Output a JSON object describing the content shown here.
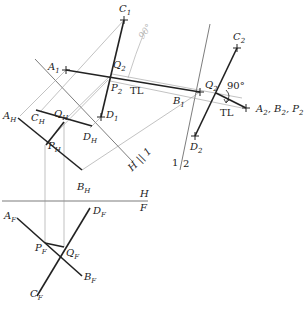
{
  "diagram": {
    "type": "descriptive-geometry",
    "views": [
      {
        "name": "H",
        "points": {
          "A": "A_H",
          "B": "B_H",
          "C": "C_H",
          "D": "D_H",
          "P": "P_H",
          "Q": "Q_H"
        }
      },
      {
        "name": "F",
        "points": {
          "A": "A_F",
          "B": "B_F",
          "C": "C_F",
          "D": "D_F",
          "P": "P_F",
          "Q": "Q_F"
        }
      },
      {
        "name": "1",
        "points": {
          "A": "A_1",
          "B": "B_1",
          "C": "C_1",
          "D": "D_1",
          "P": "P_2",
          "Q": "Q_2"
        }
      },
      {
        "name": "2",
        "points": {
          "C": "C_2",
          "D": "D_2",
          "Q": "Q_2",
          "APB": "A_2, B_2, P_2"
        }
      }
    ],
    "fold_lines": [
      {
        "top": "H",
        "bottom": "F"
      },
      {
        "label": "H|1"
      },
      {
        "label": "1|2"
      }
    ],
    "annotations": {
      "tl_1": "TL",
      "tl_2": "TL",
      "angle": "90°",
      "handwritten": "90°"
    }
  },
  "labels": {
    "c1": {
      "main": "C",
      "sub": "1"
    },
    "a1": {
      "main": "A",
      "sub": "1"
    },
    "q2a": {
      "main": "Q",
      "sub": "2"
    },
    "p2": {
      "main": "P",
      "sub": "2"
    },
    "tl1": "TL",
    "b1": {
      "main": "B",
      "sub": "1"
    },
    "d1": {
      "main": "D",
      "sub": "1"
    },
    "ah": {
      "main": "A",
      "sub": "H"
    },
    "ch": {
      "main": "C",
      "sub": "H"
    },
    "qh": {
      "main": "Q",
      "sub": "H"
    },
    "dh": {
      "main": "D",
      "sub": "H"
    },
    "ph": {
      "main": "P",
      "sub": "H"
    },
    "bh": {
      "main": "B",
      "sub": "H"
    },
    "h1": {
      "left": "H",
      "right": "1"
    },
    "f12": {
      "left": "1",
      "right": "2"
    },
    "c2": {
      "main": "C",
      "sub": "2"
    },
    "q2b": {
      "main": "Q",
      "sub": "2"
    },
    "angle": "90°",
    "tl2": "TL",
    "abp2": {
      "a": "A",
      "b": "B",
      "p": "P",
      "sub": "2",
      "sep": ", "
    },
    "d2": {
      "main": "D",
      "sub": "2"
    },
    "hf": {
      "top": "H",
      "bottom": "F"
    },
    "af": {
      "main": "A",
      "sub": "F"
    },
    "df": {
      "main": "D",
      "sub": "F"
    },
    "pf": {
      "main": "P",
      "sub": "F"
    },
    "qf": {
      "main": "Q",
      "sub": "F"
    },
    "bf": {
      "main": "B",
      "sub": "F"
    },
    "cf": {
      "main": "C",
      "sub": "F"
    },
    "handwritten": "90°"
  }
}
